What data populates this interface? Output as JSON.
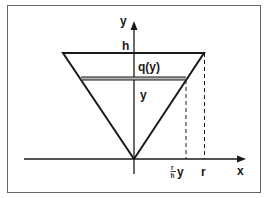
{
  "diagram": {
    "labels": {
      "y_axis": "y",
      "x_axis": "x",
      "h": "h",
      "q": "q(y)",
      "y_level": "y",
      "frac_num": "r",
      "frac_den": "h",
      "frac_suffix": "y",
      "r": "r"
    },
    "colors": {
      "stroke": "#1a1a1a",
      "band_fill": "#b8b8b8",
      "frame": "#555555",
      "background": "#ffffff"
    }
  }
}
